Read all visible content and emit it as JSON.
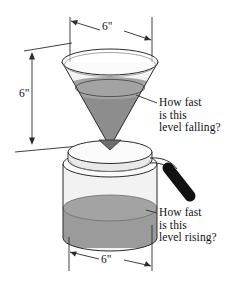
{
  "figure": {
    "background_color": "#ffffff",
    "line_color": "#2b2b2b",
    "liquid_color_cone": "#8d8d8d",
    "liquid_color_cylinder": "#9b9b9b",
    "liquid_surface_color": "#a3a3a3",
    "handle_color": "#111111",
    "glass_color": "#f2f2f2"
  },
  "dimensions": {
    "cone_top_diameter": {
      "label": "6\"",
      "name": "cone-diameter",
      "orientation": "horizontal",
      "position": "top"
    },
    "cone_height": {
      "label": "6\"",
      "name": "cone-height",
      "orientation": "vertical",
      "position": "left"
    },
    "pot_diameter": {
      "label": "6\"",
      "name": "pot-diameter",
      "orientation": "horizontal",
      "position": "bottom"
    }
  },
  "callouts": {
    "falling": {
      "lines": [
        "How fast",
        "is this",
        "level falling?"
      ],
      "points_to": "cone-liquid-surface"
    },
    "rising": {
      "lines": [
        "How fast",
        "is this",
        "level rising?"
      ],
      "points_to": "cylinder-liquid-surface"
    }
  },
  "objects": {
    "funnel": "inverted-cone-funnel",
    "pot": "cylindrical-coffee-pot",
    "lid": "pot-lid",
    "handle": "pot-handle"
  }
}
